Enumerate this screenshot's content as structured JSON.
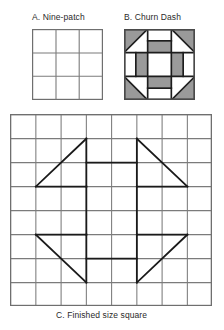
{
  "document": {
    "kind": "quilt-block-diagram-sheet",
    "background_color": "#ffffff",
    "width": 224,
    "height": 330
  },
  "palette": {
    "grid_line": "#7b7b7b",
    "pattern_line": "#1a1a1a",
    "patch_fill_light": "#ffffff",
    "patch_fill_gray": "#9a9a9a",
    "text": "#2a2a2a",
    "block_border": "#4a4a4a"
  },
  "figures": [
    {
      "id": "ninepatch",
      "caption": "A.  Nine-patch",
      "label_letter": "A.",
      "label_text": "Nine-patch",
      "type": "grid",
      "rows": 3,
      "cols": 3,
      "cell_size_px": 23.6,
      "fill": "#ffffff",
      "line_color": "#7b7b7b",
      "description": "Plain three-by-three grid of equal square patches"
    },
    {
      "id": "churndash",
      "caption": "B.  Churn Dash",
      "label_letter": "B.",
      "label_text": "Churn Dash",
      "type": "pieced-block",
      "rows": 3,
      "cols": 3,
      "cell_size_px": 23.6,
      "units": [
        {
          "position": "top-left",
          "unit": "half-square-triangle",
          "orientation": "triangle-upper-left",
          "fill": "#9a9a9a"
        },
        {
          "position": "top-center",
          "unit": "dash-rectangle",
          "orientation": "horizontal-lower",
          "fill": "#9a9a9a"
        },
        {
          "position": "top-right",
          "unit": "half-square-triangle",
          "orientation": "triangle-upper-right",
          "fill": "#9a9a9a"
        },
        {
          "position": "middle-left",
          "unit": "dash-rectangle",
          "orientation": "vertical-right",
          "fill": "#9a9a9a"
        },
        {
          "position": "center",
          "unit": "plain-square",
          "orientation": "none",
          "fill": "#ffffff"
        },
        {
          "position": "middle-right",
          "unit": "dash-rectangle",
          "orientation": "vertical-left",
          "fill": "#9a9a9a"
        },
        {
          "position": "bottom-left",
          "unit": "half-square-triangle",
          "orientation": "triangle-lower-left",
          "fill": "#9a9a9a"
        },
        {
          "position": "bottom-center",
          "unit": "dash-rectangle",
          "orientation": "horizontal-upper",
          "fill": "#9a9a9a"
        },
        {
          "position": "bottom-right",
          "unit": "half-square-triangle",
          "orientation": "triangle-lower-right",
          "fill": "#9a9a9a"
        }
      ]
    },
    {
      "id": "finished",
      "caption": "C.  Finished size square",
      "label_letter": "C.",
      "label_text": "Finished size square",
      "type": "graph-paper-overlay",
      "grid_rows": 8,
      "grid_cols": 8,
      "cell_width_px": 25.25,
      "cell_height_px": 24.0,
      "grid_line_color": "#7b7b7b",
      "pattern_line_color": "#1a1a1a",
      "pattern_name": "Churn Dash",
      "pattern_scale_cells": "each block patch spans 2 grid cells; drafted on an 8 x 8 graph with 1-cell seam margin",
      "pattern_segments": [
        {
          "name": "top-left-triangle-hypotenuse",
          "from": [
            1,
            3
          ],
          "to": [
            3,
            1
          ]
        },
        {
          "name": "top-right-triangle-hypotenuse",
          "from": [
            5,
            1
          ],
          "to": [
            7,
            3
          ]
        },
        {
          "name": "bottom-left-triangle-hypotenuse",
          "from": [
            1,
            5
          ],
          "to": [
            3,
            7
          ]
        },
        {
          "name": "bottom-right-triangle-hypotenuse",
          "from": [
            5,
            7
          ],
          "to": [
            7,
            5
          ]
        },
        {
          "name": "top-dash-left-leg",
          "from": [
            3,
            1
          ],
          "to": [
            3,
            3
          ]
        },
        {
          "name": "top-dash-right-leg",
          "from": [
            5,
            1
          ],
          "to": [
            5,
            3
          ]
        },
        {
          "name": "top-dash-inner-bar",
          "from": [
            3,
            3
          ],
          "to": [
            5,
            3
          ]
        },
        {
          "name": "bottom-dash-left-leg",
          "from": [
            3,
            5
          ],
          "to": [
            3,
            7
          ]
        },
        {
          "name": "bottom-dash-right-leg",
          "from": [
            5,
            5
          ],
          "to": [
            5,
            7
          ]
        },
        {
          "name": "bottom-dash-inner-bar",
          "from": [
            3,
            5
          ],
          "to": [
            5,
            5
          ]
        },
        {
          "name": "left-dash-outer-leg",
          "from": [
            3,
            3
          ],
          "to": [
            3,
            5
          ]
        },
        {
          "name": "left-dash-top-bar",
          "from": [
            1,
            3
          ],
          "to": [
            3,
            3
          ]
        },
        {
          "name": "left-dash-bottom-bar",
          "from": [
            1,
            5
          ],
          "to": [
            3,
            5
          ]
        },
        {
          "name": "right-dash-outer-leg",
          "from": [
            5,
            3
          ],
          "to": [
            5,
            5
          ]
        },
        {
          "name": "right-dash-top-bar",
          "from": [
            5,
            3
          ],
          "to": [
            7,
            3
          ]
        },
        {
          "name": "right-dash-bottom-bar",
          "from": [
            5,
            5
          ],
          "to": [
            7,
            5
          ]
        }
      ]
    }
  ]
}
